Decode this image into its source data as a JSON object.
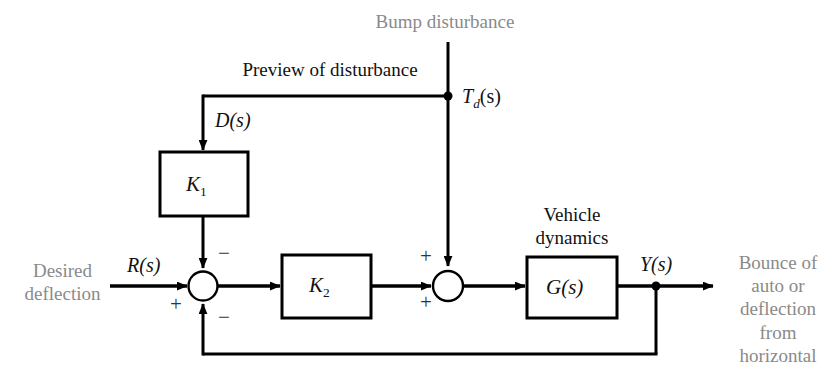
{
  "diagram": {
    "colors": {
      "line": "#000000",
      "grey_text": "#8a8a8a",
      "black_text": "#111111",
      "background": "#ffffff"
    },
    "labels": {
      "bump_disturbance": "Bump disturbance",
      "preview_of_disturbance": "Preview of disturbance",
      "desired_deflection_line1": "Desired",
      "desired_deflection_line2": "deflection",
      "vehicle_line1": "Vehicle",
      "vehicle_line2": "dynamics",
      "output_line1": "Bounce of",
      "output_line2": "auto or",
      "output_line3": "deflection",
      "output_line4": "from",
      "output_line5": "horizontal"
    },
    "signals": {
      "reference": "R(s)",
      "preview": "D(s)",
      "disturbance_base": "T",
      "disturbance_sub": "d",
      "disturbance_tail": "(s)",
      "output": "Y(s)"
    },
    "blocks": [
      {
        "id": "k1",
        "base": "K",
        "sub": "1"
      },
      {
        "id": "k2",
        "base": "K",
        "sub": "2"
      },
      {
        "id": "g",
        "base": "G(s)",
        "sub": ""
      }
    ],
    "summing_junction_1": {
      "name": "error-summing-junction",
      "sign_reference": "+",
      "sign_preview": "−",
      "sign_feedback": "−"
    },
    "summing_junction_2": {
      "name": "disturbance-summing-junction",
      "sign_forward": "+",
      "sign_disturbance": "+"
    }
  }
}
